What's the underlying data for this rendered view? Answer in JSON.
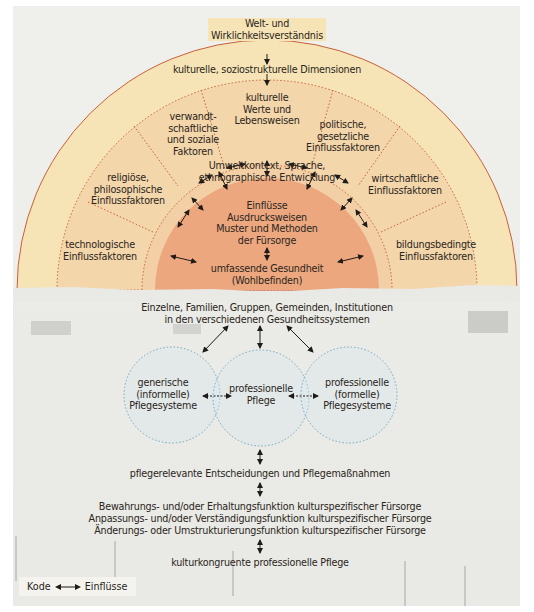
{
  "diagram": {
    "top": {
      "world_view": "Welt- und\nWirklichkeitsverständnis",
      "dimensions": "kulturelle, soziostrukturelle Dimensionen"
    },
    "sectors": {
      "cultural_values": "kulturelle\nWerte und\nLebensweisen",
      "kinship_social": "verwandt-\nschaftliche\nund soziale\nFaktoren",
      "political_legal": "politische,\ngesetzliche\nEinflussfaktoren",
      "religious_philosophical": "religiöse,\nphilosophische\nEinflussfaktoren",
      "economic": "wirtschaftliche\nEinflussfaktoren",
      "technological": "technologische\nEinflussfaktoren",
      "educational": "bildungsbedingte\nEinflussfaktoren"
    },
    "environment": "Umweltkontext, Sprache,\nethnographische Entwicklung",
    "core": {
      "care": "Einflüsse\nAusdrucksweisen\nMuster und Methoden\nder Fürsorge",
      "health": "umfassende Gesundheit\n(Wohlbefinden)"
    },
    "population": "Einzelne, Familien, Gruppen, Gemeinden, Institutionen\nin den verschiedenen Gesundheitssystemen",
    "circles": [
      {
        "label": "generische\n(informelle)\nPflegesysteme"
      },
      {
        "label": "professionelle\nPflege"
      },
      {
        "label": "professionelle\n(formelle)\nPflegesysteme"
      }
    ],
    "decisions": "pflegerelevante Entscheidungen und Pflegemaßnahmen",
    "functions": [
      "Bewahrungs- und/oder Erhaltungsfunktion kulturspezifischer Fürsorge",
      "Anpassungs- und/oder Verständigungsfunktion kulturspezifischer Fürsorge",
      "Änderungs- oder Umstrukturierungsfunktion kulturspezifischer Fürsorge"
    ],
    "outcome": "kulturkongruente professionelle Pflege"
  },
  "legend": {
    "code": "Kode",
    "influences": "Einflüsse"
  },
  "colors": {
    "outer_ring": "#f7e4b6",
    "middle_ring": "#f4d6ab",
    "core": "#eca77f",
    "ring_border": "#c9603a",
    "circle_border": "#6fa8c4",
    "circle_fill": "#d7e8ef"
  }
}
